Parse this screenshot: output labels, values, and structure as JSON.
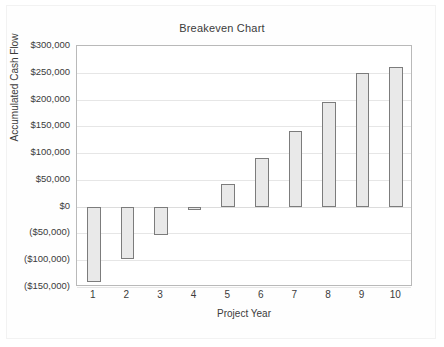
{
  "chart_data": {
    "type": "bar",
    "title": "Breakeven Chart",
    "xlabel": "Project Year",
    "ylabel": "Accumulated Cash Flow",
    "categories": [
      "1",
      "2",
      "3",
      "4",
      "5",
      "6",
      "7",
      "8",
      "9",
      "10"
    ],
    "values": [
      -140000,
      -98000,
      -52000,
      -4000,
      42000,
      91000,
      141000,
      195000,
      250000,
      261000
    ],
    "baseline": 0,
    "bar_style": "floating-from-zero",
    "ylim": [
      -150000,
      300000
    ],
    "ytick_values": [
      300000,
      250000,
      200000,
      150000,
      100000,
      50000,
      0,
      -50000,
      -100000,
      -150000
    ],
    "ytick_labels": [
      "$300,000",
      "$250,000",
      "$200,000",
      "$150,000",
      "$100,000",
      "$50,000",
      "$0",
      "($50,000)",
      "($100,000)",
      "($150,000)"
    ],
    "grid": true,
    "legend": false,
    "colors": {
      "bar_fill": "#e9e9e9",
      "bar_border": "#7c7c7c",
      "gridline": "#e6e6e6",
      "plot_border": "#b9b9b9",
      "text": "#3b3b3b"
    }
  }
}
